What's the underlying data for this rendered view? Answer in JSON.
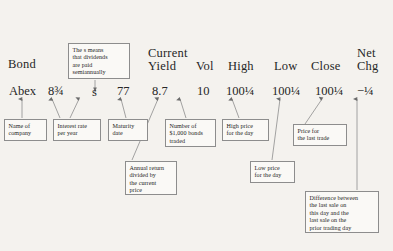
{
  "meta": {
    "background_color": "#f4f2ee",
    "box_border_color": "#8d8d8d",
    "box_fill_color": "#faf9f6",
    "text_color": "#262626"
  },
  "headers": {
    "bond": "Bond",
    "coupon": "",
    "maturity": "",
    "price": "",
    "current_yield": "Current\nYield",
    "vol": "Vol",
    "high": "High",
    "low": "Low",
    "close": "Close",
    "net_chg": "Net\nChg"
  },
  "quote_row": {
    "bond": "Abex",
    "coupon": "8¾",
    "maturity_mark": "s",
    "price": "77",
    "current_yield": "8.7",
    "vol": "10",
    "high": "100¼",
    "low": "100¼",
    "close": "100¼",
    "net_chg": "−¼"
  },
  "callouts": {
    "name_of_company": "Name of\ncompany",
    "interest_rate": "Interest rate\nper year",
    "maturity_date": "Maturity\ndate",
    "semiannual_note": "The s means\nthat dividends\nare paid\nsemiannually",
    "bonds_traded": "Number of\n$1,000 bonds\ntraded",
    "annual_return": "Annual return\ndivided by\nthe current\nprice",
    "high_price": "High price\nfor the day",
    "low_price": "Low price\nfor the day",
    "last_trade_price": "Price for\nthe last trade",
    "net_change_note": "Difference between\nthe last sale on\nthis day and the\nlast sale on the\nprior trading day"
  }
}
